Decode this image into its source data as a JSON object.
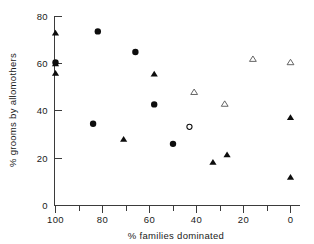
{
  "chart_data": {
    "type": "scatter",
    "title": "",
    "xlabel": "% families dominated",
    "ylabel": "% grooms by allomothers",
    "xlim": [
      105,
      -5
    ],
    "ylim": [
      0,
      83
    ],
    "x_axis_inverted": true,
    "grid": false,
    "legend": "none",
    "xticks": [
      100,
      80,
      60,
      40,
      20,
      0
    ],
    "xticklabels": [
      "100",
      "80",
      "60",
      "40",
      "20",
      "0"
    ],
    "x_minor_ticks": [
      90,
      70,
      50,
      30,
      10
    ],
    "yticks": [
      0,
      20,
      40,
      60,
      80
    ],
    "yticklabels": [
      "0",
      "20",
      "40",
      "60",
      "80"
    ],
    "series": [
      {
        "name": "filled-circle",
        "marker": "filled circle",
        "points": [
          {
            "x": 100,
            "y": 60.5
          },
          {
            "x": 82,
            "y": 73.7
          },
          {
            "x": 66,
            "y": 65.0
          },
          {
            "x": 58,
            "y": 42.8
          },
          {
            "x": 84,
            "y": 34.6
          },
          {
            "x": 50,
            "y": 26.1
          }
        ]
      },
      {
        "name": "open-circle",
        "marker": "open circle",
        "points": [
          {
            "x": 43,
            "y": 33.3
          }
        ]
      },
      {
        "name": "filled-triangle",
        "marker": "filled triangle",
        "points": [
          {
            "x": 100,
            "y": 73.0
          },
          {
            "x": 100,
            "y": 60.0
          },
          {
            "x": 100,
            "y": 56.0
          },
          {
            "x": 58,
            "y": 55.7
          },
          {
            "x": 71,
            "y": 28.0
          },
          {
            "x": 33,
            "y": 18.3
          },
          {
            "x": 27,
            "y": 21.5
          },
          {
            "x": 0,
            "y": 37.3
          },
          {
            "x": 0,
            "y": 12.0
          }
        ]
      },
      {
        "name": "open-triangle",
        "marker": "open triangle",
        "points": [
          {
            "x": 41,
            "y": 48.0
          },
          {
            "x": 28,
            "y": 43.0
          },
          {
            "x": 16,
            "y": 62.0
          },
          {
            "x": 0,
            "y": 60.6
          }
        ]
      }
    ]
  },
  "axes": {
    "x_title": "% families dominated",
    "y_title": "% grooms by allomothers"
  }
}
